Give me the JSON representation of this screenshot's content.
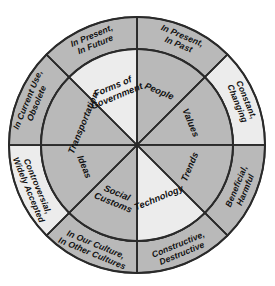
{
  "diagram": {
    "type": "circular-wheel",
    "colors": {
      "segment_gray": "#b9b9b9",
      "segment_light": "#ececec",
      "outline": "#2a2a2a",
      "background": "#ffffff",
      "text": "#111111"
    },
    "geometry": {
      "center_x": 137,
      "center_y": 145,
      "outer_radius": 128,
      "inner_radius": 96,
      "segment_count": 8
    },
    "inner_wedges": [
      {
        "id": "people",
        "label": "People",
        "shade": "gray",
        "angle_start": -90,
        "angle_end": -45
      },
      {
        "id": "values",
        "label": "Values",
        "shade": "gray",
        "angle_start": -45,
        "angle_end": 0
      },
      {
        "id": "trends",
        "label": "Trends",
        "shade": "gray",
        "angle_start": 0,
        "angle_end": 45
      },
      {
        "id": "technology",
        "label": "Technology",
        "shade": "light",
        "angle_start": 45,
        "angle_end": 90
      },
      {
        "id": "social-customs",
        "label": "Social Customs",
        "shade": "gray",
        "angle_start": 90,
        "angle_end": 135
      },
      {
        "id": "ideas",
        "label": "Ideas",
        "shade": "gray",
        "angle_start": 135,
        "angle_end": 180
      },
      {
        "id": "transportation",
        "label": "Transportation",
        "shade": "gray",
        "angle_start": 180,
        "angle_end": 225
      },
      {
        "id": "forms-of-government",
        "label": "Forms of Government",
        "shade": "light",
        "angle_start": 225,
        "angle_end": 270
      }
    ],
    "inner_wedge_lines": {
      "people": [
        "People"
      ],
      "values": [
        "Values"
      ],
      "trends": [
        "Trends"
      ],
      "technology": [
        "Technology"
      ],
      "social-customs": [
        "Social",
        "Customs"
      ],
      "ideas": [
        "Ideas"
      ],
      "transportation": [
        "Transportation"
      ],
      "forms-of-government": [
        "Forms of",
        "Government"
      ]
    },
    "outer_ring_segments": [
      {
        "id": "in-present-in-past",
        "label": "In Present, In Past",
        "shade": "gray",
        "angle_start": -90,
        "angle_end": -45
      },
      {
        "id": "constant-changing",
        "label": "Constant, Changing",
        "shade": "light",
        "angle_start": -45,
        "angle_end": 0
      },
      {
        "id": "beneficial-harmful",
        "label": "Beneficial, Harmful",
        "shade": "gray",
        "angle_start": 0,
        "angle_end": 45
      },
      {
        "id": "constructive-destructive",
        "label": "Constructive, Destructive",
        "shade": "gray",
        "angle_start": 45,
        "angle_end": 90
      },
      {
        "id": "in-our-culture-in-other-cultures",
        "label": "In Our Culture, In Other Cultures",
        "shade": "gray",
        "angle_start": 90,
        "angle_end": 135
      },
      {
        "id": "controversial-widely-accepted",
        "label": "Controversial, Widely Accepted",
        "shade": "light",
        "angle_start": 135,
        "angle_end": 180
      },
      {
        "id": "in-current-use-obsolete",
        "label": "In Current Use, Obsolete",
        "shade": "gray",
        "angle_start": 180,
        "angle_end": 225
      },
      {
        "id": "in-present-in-future",
        "label": "In Present, In Future",
        "shade": "gray",
        "angle_start": 225,
        "angle_end": 270
      }
    ],
    "outer_ring_lines": {
      "in-present-in-past": [
        "In Present,",
        "In Past"
      ],
      "constant-changing": [
        "Constant,",
        "Changing"
      ],
      "beneficial-harmful": [
        "Beneficial,",
        "Harmful"
      ],
      "constructive-destructive": [
        "Constructive,",
        "Destructive"
      ],
      "in-our-culture-in-other-cultures": [
        "In Our Culture,",
        "In Other Cultures"
      ],
      "controversial-widely-accepted": [
        "Controversial,",
        "Widely Accepted"
      ],
      "in-current-use-obsolete": [
        "In Current Use,",
        "Obsolete"
      ],
      "in-present-in-future": [
        "In Present,",
        "In Future"
      ]
    }
  }
}
